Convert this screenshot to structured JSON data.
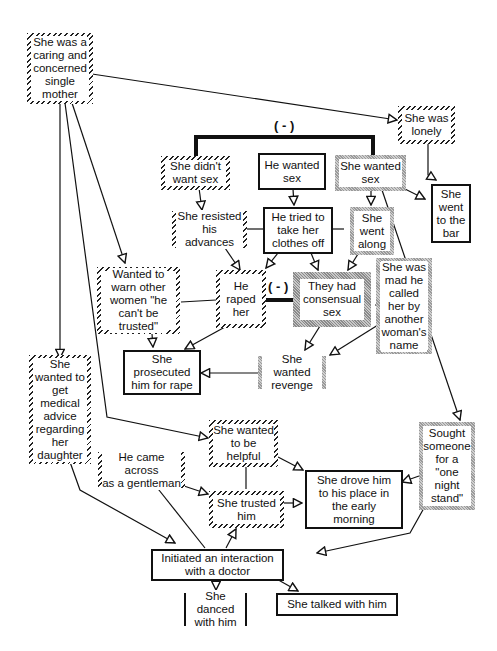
{
  "diagram": {
    "type": "causal-network",
    "nodes": {
      "caring_mother": "She was a\ncaring and\nconcerned\nsingle\nmother",
      "lonely": "She was\nlonely",
      "didnt_want_sex": "She didn't\nwant sex",
      "he_wanted_sex": "He wanted\nsex",
      "she_wanted_sex": "She wanted\nsex",
      "went_to_bar": "She\nwent\nto the\nbar",
      "resisted": "She resisted\nhis advances",
      "tried_clothes": "He tried to\ntake her\nclothes  off",
      "went_along": "She\nwent\nalong",
      "warn_women": "Wanted to\nwarn other\nwomen \"he\ncan't be\ntrusted\"",
      "raped_her": "He\nraped\nher",
      "consensual": "They had\nconsensual\nsex",
      "mad_name": "She was\nmad he\ncalled\nher by\nanother\nwoman's\nname",
      "medical_advice": "She\nwanted to\nget\nmedical\nadvice\nregarding\nher\ndaughter",
      "prosecuted": "She\nprosecuted\nhim for rape",
      "revenge": "She wanted\nrevenge",
      "helpful": "She wanted\nto be\nhelpful",
      "one_night": "Sought\nsomeone\nfor a\n\"one\nnight\nstand\"",
      "gentleman": "He came across\nas a gentleman",
      "trusted": "She trusted\nhim",
      "drove_him": "She drove  him\nto his place in\nthe early\nmorning",
      "initiated": "Initiated  an  interaction\nwith a doctor",
      "danced": "She danced\nwith  him",
      "talked": "She  talked  with  him"
    },
    "conflict_labels": {
      "top": "( - )",
      "middle": "( - )"
    },
    "legend_styles": {
      "hatched": "defense account (she)",
      "solid": "shared events",
      "grey": "alternative account"
    },
    "colors": {
      "line": "#111111",
      "grey_border": "#a0a0a0"
    }
  }
}
